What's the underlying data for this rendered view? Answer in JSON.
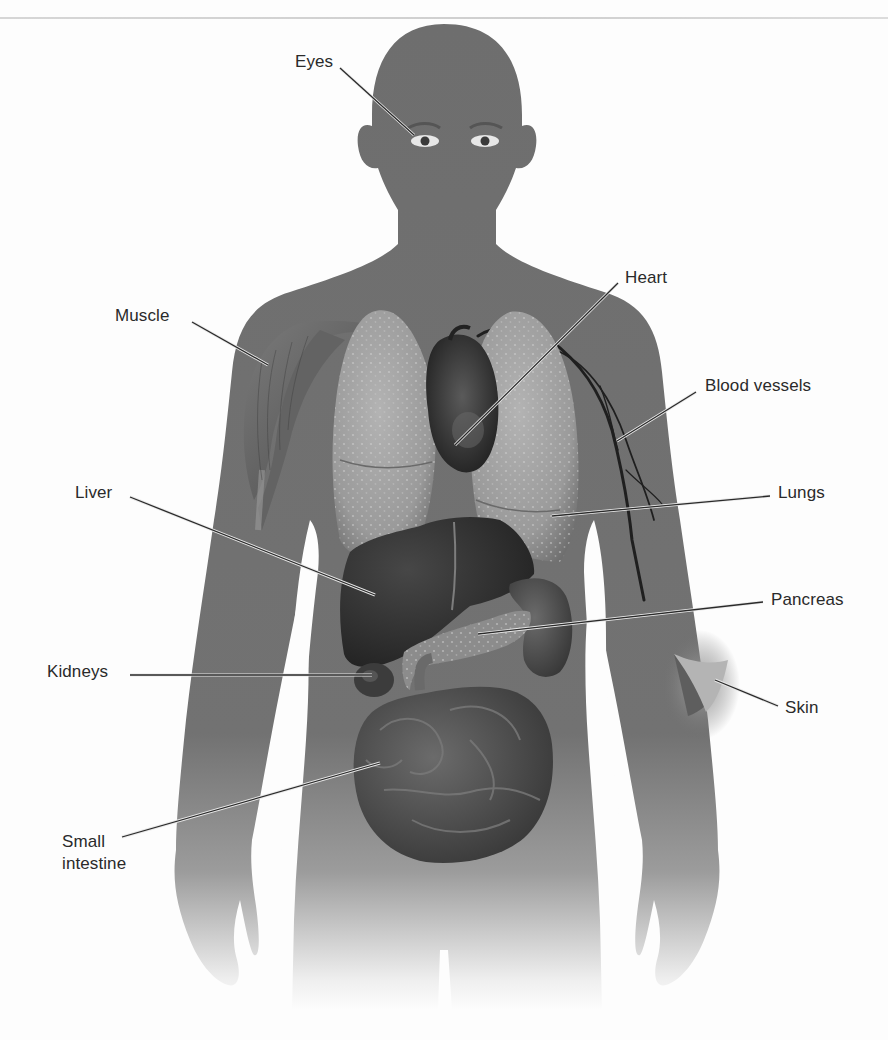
{
  "figure": {
    "colors": {
      "background": "#fdfdfd",
      "silhouette": "#6e6e6e",
      "silhouette_fade": "#f4f4f4",
      "lung": "#9a9a9a",
      "lung_highlight": "#b8b8b8",
      "liver": "#2c2c2c",
      "heart": "#343434",
      "kidney": "#3c3c3c",
      "pancreas": "#8c8c8c",
      "intestine": "#4d4d4d",
      "muscle": "#585858",
      "skin_flap": "#b4b4b4",
      "leader_line": "#2a2a2a",
      "label_text": "#2a2a2a"
    }
  },
  "labels": [
    {
      "id": "eyes",
      "text": "Eyes",
      "x": 295,
      "y": 56,
      "line": {
        "x1": 340,
        "y1": 68,
        "x2": 414,
        "y2": 135
      }
    },
    {
      "id": "muscle",
      "text": "Muscle",
      "x": 115,
      "y": 310,
      "line": {
        "x1": 192,
        "y1": 322,
        "x2": 268,
        "y2": 365
      }
    },
    {
      "id": "heart",
      "text": "Heart",
      "x": 625,
      "y": 272,
      "line": {
        "x1": 618,
        "y1": 283,
        "x2": 455,
        "y2": 445
      }
    },
    {
      "id": "blood-vessels",
      "text": "Blood vessels",
      "x": 705,
      "y": 380,
      "line": {
        "x1": 696,
        "y1": 392,
        "x2": 617,
        "y2": 441
      }
    },
    {
      "id": "liver",
      "text": "Liver",
      "x": 75,
      "y": 487,
      "line": {
        "x1": 130,
        "y1": 497,
        "x2": 375,
        "y2": 595
      }
    },
    {
      "id": "lungs",
      "text": "Lungs",
      "x": 778,
      "y": 487,
      "line": {
        "x1": 770,
        "y1": 496,
        "x2": 552,
        "y2": 516
      }
    },
    {
      "id": "pancreas",
      "text": "Pancreas",
      "x": 771,
      "y": 594,
      "line": {
        "x1": 763,
        "y1": 602,
        "x2": 478,
        "y2": 634
      }
    },
    {
      "id": "kidneys",
      "text": "Kidneys",
      "x": 47,
      "y": 666,
      "line": {
        "x1": 130,
        "y1": 675,
        "x2": 372,
        "y2": 675
      }
    },
    {
      "id": "skin",
      "text": "Skin",
      "x": 785,
      "y": 702,
      "line": {
        "x1": 778,
        "y1": 706,
        "x2": 715,
        "y2": 680
      }
    },
    {
      "id": "small-intestine",
      "text": "Small\nintestine",
      "x": 62,
      "y": 835,
      "line": {
        "x1": 122,
        "y1": 837,
        "x2": 380,
        "y2": 763
      }
    }
  ]
}
